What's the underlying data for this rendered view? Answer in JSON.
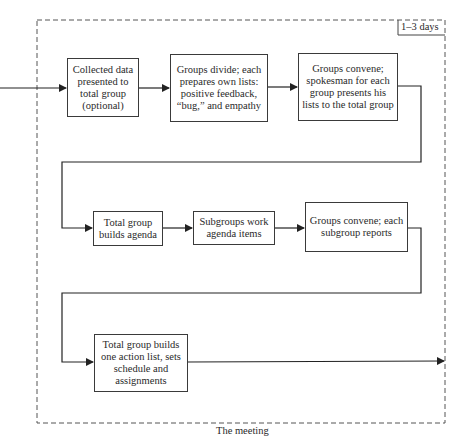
{
  "duration_label": "1–3 days",
  "caption": "The meeting",
  "steps": [
    {
      "id": 1,
      "text": "Collected data presented to total group (optional)"
    },
    {
      "id": 2,
      "text": "Groups divide; each prepares own lists: positive feedback, “bug,” and empathy"
    },
    {
      "id": 3,
      "text": "Groups convene; spokesman for each group presents his lists to the total group"
    },
    {
      "id": 4,
      "text": "Total group builds agenda"
    },
    {
      "id": 5,
      "text": "Subgroups work agenda items"
    },
    {
      "id": 6,
      "text": "Groups convene; each subgroup reports"
    },
    {
      "id": 7,
      "text": "Total group builds one action list, sets schedule and assignments"
    }
  ]
}
